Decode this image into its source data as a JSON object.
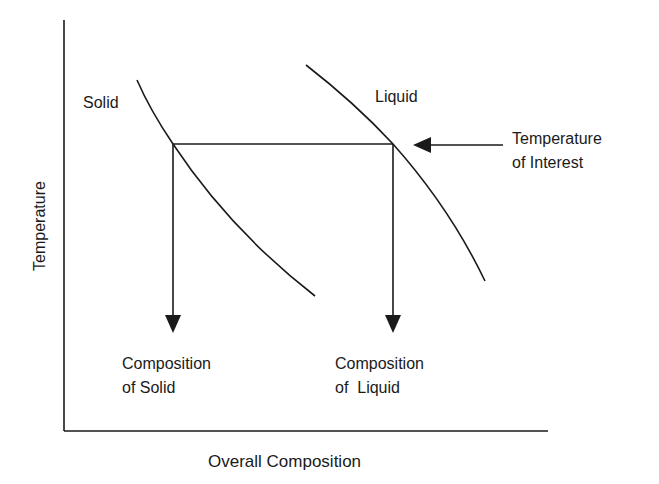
{
  "diagram": {
    "title": "",
    "axes": {
      "x_label": "Overall Composition",
      "y_label": "Temperature"
    },
    "curves": {
      "solid_label": "Solid",
      "liquid_label": "Liquid"
    },
    "annotations": {
      "temperature_of_interest": {
        "line1": "Temperature",
        "line2": "of Interest"
      },
      "composition_of_solid": {
        "line1": "Composition",
        "line2": "of Solid"
      },
      "composition_of_liquid": {
        "line1": "Composition",
        "line2": "of  Liquid"
      }
    },
    "colors": {
      "line": "#1a1a1a",
      "background": "#ffffff"
    }
  }
}
